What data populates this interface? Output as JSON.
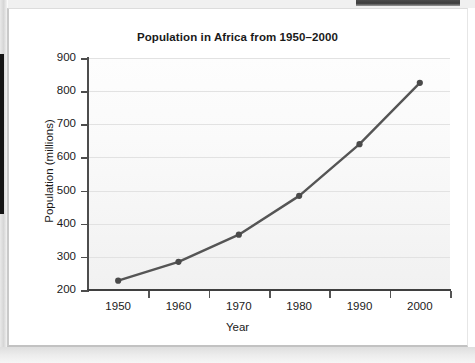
{
  "chart_data": {
    "type": "line",
    "title": "Population in Africa from 1950–2000",
    "xlabel": "Year",
    "ylabel": "Population (millions)",
    "categories": [
      "1950",
      "1960",
      "1970",
      "1980",
      "1990",
      "2000"
    ],
    "x": [
      1950,
      1960,
      1970,
      1980,
      1990,
      2000
    ],
    "values": [
      228,
      285,
      367,
      484,
      640,
      825
    ],
    "series": [
      {
        "name": "Population in Africa",
        "values": [
          228,
          285,
          367,
          484,
          640,
          825
        ]
      }
    ],
    "ylim": [
      200,
      900
    ],
    "yticks": [
      200,
      300,
      400,
      500,
      600,
      700,
      800,
      900
    ],
    "ytick_labels": [
      "200",
      "300",
      "400",
      "500",
      "600",
      "700",
      "800",
      "900"
    ],
    "xticks": [
      1950,
      1960,
      1970,
      1980,
      1990,
      2000
    ],
    "xtick_labels": [
      "1950",
      "1960",
      "1970",
      "1980",
      "1990",
      "2000"
    ],
    "grid": "horizontal",
    "legend": "none",
    "annotations": [],
    "colors": {
      "line": "#555555",
      "marker": "#4a4a4a",
      "grid": "#e2e2e2",
      "axis": "#3f3f3f",
      "text": "#1a1a1a",
      "plot_background": "#f7f7f7",
      "page_background": "#ffffff"
    }
  }
}
